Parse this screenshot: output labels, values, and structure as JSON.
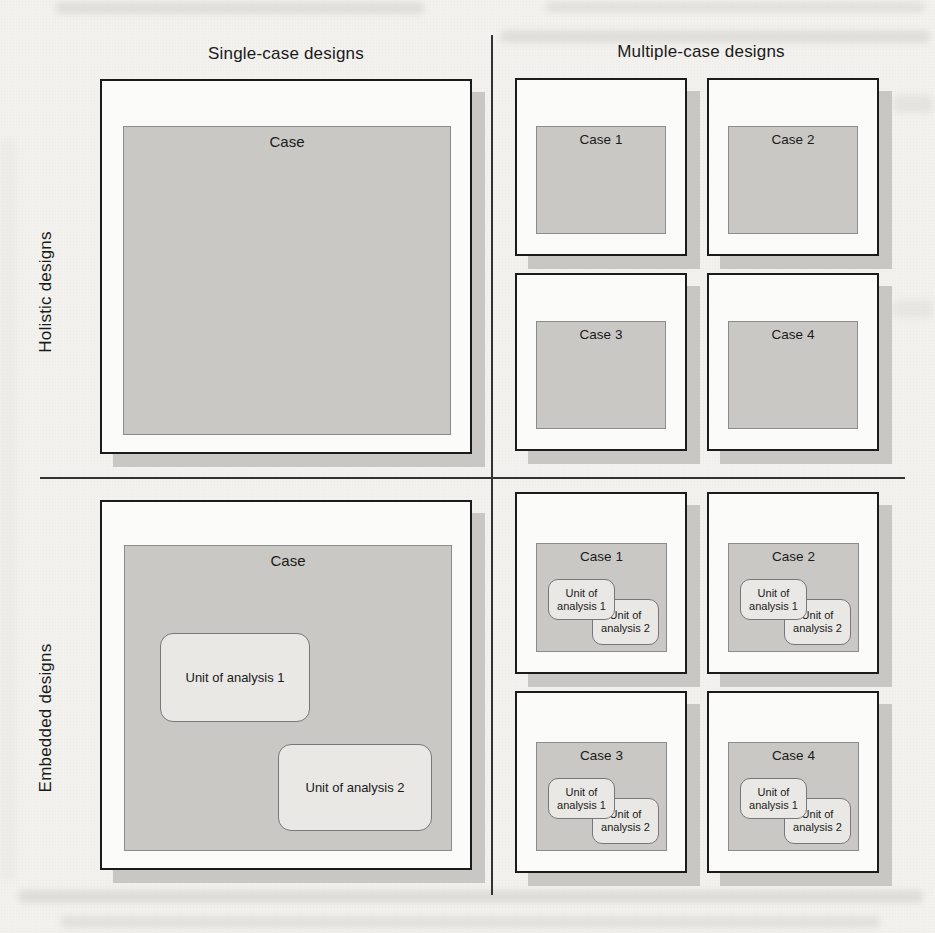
{
  "figure": {
    "columns": [
      {
        "title": "Single-case designs"
      },
      {
        "title": "Multiple-case designs"
      }
    ],
    "rows": [
      {
        "title": "Holistic designs"
      },
      {
        "title": "Embedded designs"
      }
    ],
    "holistic_single": {
      "case_label": "Case"
    },
    "holistic_multiple": {
      "cases": [
        "Case 1",
        "Case 2",
        "Case 3",
        "Case 4"
      ]
    },
    "embedded_single": {
      "case_label": "Case",
      "units": [
        "Unit of analysis 1",
        "Unit of analysis 2"
      ]
    },
    "embedded_multiple": {
      "cases": [
        "Case 1",
        "Case 2",
        "Case 3",
        "Case 4"
      ],
      "unit1": [
        "Unit of",
        "analysis 1"
      ],
      "unit2": [
        "Unit of",
        "analysis 2"
      ]
    },
    "colors": {
      "paper": "#f2f1ed",
      "box_fill": "#fbfbf9",
      "case_fill": "#c9c8c4",
      "unit_fill": "#e9e8e4",
      "shadow": "#c8c7c3",
      "border": "#1b1b1b",
      "divider": "#333333"
    }
  }
}
